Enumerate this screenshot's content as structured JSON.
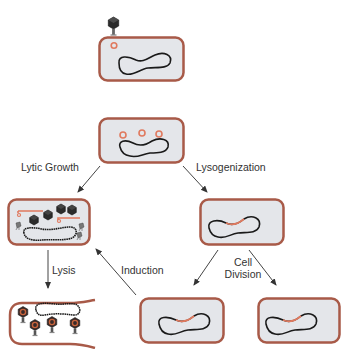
{
  "diagram": {
    "type": "bacteriophage life cycle",
    "colors": {
      "cell_fill": "#e4e6ea",
      "cell_wall": "#a85a48",
      "prophage": "#e07a5f",
      "chromosome": "#1a1a1a",
      "phage_head": "#2b2b2b",
      "arrow": "#444444"
    },
    "labels": {
      "lytic_growth": "Lytic Growth",
      "lysogenization": "Lysogenization",
      "lysis": "Lysis",
      "induction": "Induction",
      "cell_division_line1": "Cell",
      "cell_division_line2": "Division"
    },
    "stages": [
      {
        "id": "infection",
        "description": "Phage attaches and injects DNA into host cell"
      },
      {
        "id": "phage-dna-in-cell",
        "description": "Phage DNA circles inside cell"
      },
      {
        "id": "lytic-replication",
        "description": "Phage heads assembling inside cell"
      },
      {
        "id": "lysogen",
        "description": "Prophage integrated into chromosome"
      },
      {
        "id": "lysis",
        "description": "Cell bursts releasing phages"
      },
      {
        "id": "daughter-lysogen-1",
        "description": "Daughter cell carrying prophage"
      },
      {
        "id": "daughter-lysogen-2",
        "description": "Daughter cell carrying prophage"
      }
    ]
  }
}
